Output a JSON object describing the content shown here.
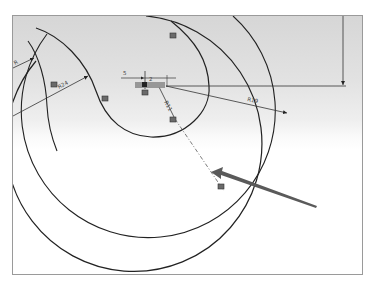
{
  "drawing": {
    "dimensions": {
      "r_outer": "R19",
      "r_mid": "R24",
      "r_inner": "R11",
      "r_left": "R",
      "horizontal_offset": "5",
      "small_offset": "2"
    },
    "constraint_icons": [
      "tangent-constraint",
      "tangent-constraint",
      "tangent-constraint",
      "coincident-constraint",
      "coincident-constraint"
    ],
    "colors": {
      "geometry": "#222222",
      "dimension": "#333333",
      "pointer_arrow": "#5a5a5a"
    }
  }
}
